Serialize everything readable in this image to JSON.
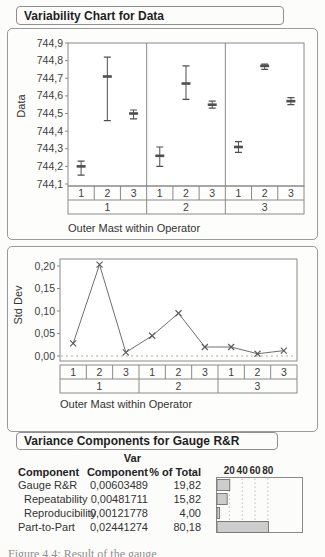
{
  "sections": {
    "variability": {
      "title": "Variability Chart for Data"
    },
    "variance": {
      "title": "Variance Components for Gauge R&R"
    }
  },
  "colors": {
    "frame": "#8a8a8a",
    "grid_table": "#8a8a8a",
    "range_bar": "#4f4f4f",
    "line": "#6e6e6e",
    "marker": "#5a5a5a",
    "ref_line": "#c9c9c0",
    "bar_fill": "#cdcdcd",
    "bar_stroke": "#7a7a7a",
    "bar_grid": "#bdbdbd"
  },
  "chart_data": [
    {
      "type": "variability-range",
      "ylabel": "Data",
      "xlabel": "Outer Mast within Operator",
      "ylim": [
        744.1,
        744.9
      ],
      "yticks": [
        {
          "v": 744.9,
          "label": "744,9"
        },
        {
          "v": 744.8,
          "label": "744,8"
        },
        {
          "v": 744.7,
          "label": "744,7"
        },
        {
          "v": 744.6,
          "label": "744,6"
        },
        {
          "v": 744.5,
          "label": "744,5"
        },
        {
          "v": 744.4,
          "label": "744,4"
        },
        {
          "v": 744.3,
          "label": "744,3"
        },
        {
          "v": 744.2,
          "label": "744,2"
        },
        {
          "v": 744.1,
          "label": "744,1"
        }
      ],
      "group_labels": [
        "1",
        "2",
        "3",
        "1",
        "2",
        "3",
        "1",
        "2",
        "3"
      ],
      "operator_labels": [
        "1",
        "2",
        "3"
      ],
      "cells": [
        {
          "operator": "1",
          "outer_mast": "1",
          "min": 744.15,
          "max": 744.23,
          "mean": 744.2
        },
        {
          "operator": "1",
          "outer_mast": "2",
          "min": 744.46,
          "max": 744.82,
          "mean": 744.71
        },
        {
          "operator": "1",
          "outer_mast": "3",
          "min": 744.47,
          "max": 744.52,
          "mean": 744.5
        },
        {
          "operator": "2",
          "outer_mast": "1",
          "min": 744.2,
          "max": 744.31,
          "mean": 744.26
        },
        {
          "operator": "2",
          "outer_mast": "2",
          "min": 744.58,
          "max": 744.77,
          "mean": 744.67
        },
        {
          "operator": "2",
          "outer_mast": "3",
          "min": 744.53,
          "max": 744.57,
          "mean": 744.55
        },
        {
          "operator": "3",
          "outer_mast": "1",
          "min": 744.28,
          "max": 744.34,
          "mean": 744.31
        },
        {
          "operator": "3",
          "outer_mast": "2",
          "min": 744.75,
          "max": 744.78,
          "mean": 744.77
        },
        {
          "operator": "3",
          "outer_mast": "3",
          "min": 744.55,
          "max": 744.59,
          "mean": 744.57
        }
      ]
    },
    {
      "type": "line",
      "ylabel": "Std Dev",
      "xlabel": "Outer Mast within Operator",
      "ylim": [
        0,
        0.2
      ],
      "yticks": [
        {
          "v": 0.2,
          "label": "0,20"
        },
        {
          "v": 0.15,
          "label": "0,15"
        },
        {
          "v": 0.1,
          "label": "0,10"
        },
        {
          "v": 0.05,
          "label": "0,05"
        },
        {
          "v": 0.0,
          "label": "0,00"
        }
      ],
      "marker": "x",
      "ref_line": 0,
      "group_labels": [
        "1",
        "2",
        "3",
        "1",
        "2",
        "3",
        "1",
        "2",
        "3"
      ],
      "operator_labels": [
        "1",
        "2",
        "3"
      ],
      "values": [
        0.028,
        0.203,
        0.008,
        0.045,
        0.095,
        0.02,
        0.02,
        0.005,
        0.012
      ]
    },
    {
      "type": "bar",
      "orientation": "horizontal",
      "categories": [
        "Gauge R&R",
        "Repeatability",
        "Reproducibility",
        "Part-to-Part"
      ],
      "values": [
        19.82,
        15.82,
        4.0,
        80.18
      ],
      "axis_ticks": [
        20,
        40,
        60,
        80
      ]
    }
  ],
  "variance_table": {
    "header": {
      "col1": "Component",
      "col2_top": "Var",
      "col2": "Component",
      "col3": "% of Total"
    },
    "rows": [
      {
        "component": "Gauge R&R",
        "indent": false,
        "var_component": "0,00603489",
        "pct_of_total": "19,82",
        "pct_value": 19.82
      },
      {
        "component": "Repeatability",
        "indent": true,
        "var_component": "0,00481711",
        "pct_of_total": "15,82",
        "pct_value": 15.82
      },
      {
        "component": "Reproducibility",
        "indent": true,
        "var_component": "0,00121778",
        "pct_of_total": "4,00",
        "pct_value": 4.0
      },
      {
        "component": "Part-to-Part",
        "indent": false,
        "var_component": "0,02441274",
        "pct_of_total": "80,18",
        "pct_value": 80.18
      }
    ]
  },
  "caption_fragment": "Figure 4.4: Result of the gauge"
}
